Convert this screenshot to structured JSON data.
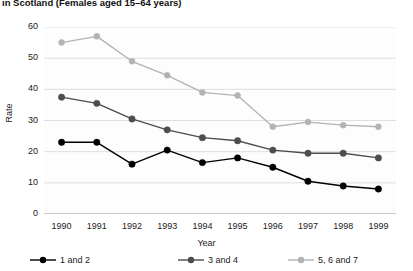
{
  "chart_data": {
    "type": "line",
    "title": "in Scotland (Females aged 15–64 years)",
    "xlabel": "Year",
    "ylabel": "Rate",
    "categories": [
      "1990",
      "1991",
      "1992",
      "1993",
      "1994",
      "1995",
      "1996",
      "1997",
      "1998",
      "1999"
    ],
    "yticks": [
      "0",
      "10",
      "20",
      "30",
      "40",
      "50",
      "60"
    ],
    "ylim": [
      0,
      60
    ],
    "grid": true,
    "legend_position": "bottom",
    "series": [
      {
        "name": "1 and 2",
        "color": "#000000",
        "values": [
          23,
          23,
          16,
          20.5,
          16.5,
          18,
          15,
          10.5,
          9,
          8
        ]
      },
      {
        "name": "3 and 4",
        "color": "#4d4d4d",
        "values": [
          37.5,
          35.5,
          30.5,
          27,
          24.5,
          23.5,
          20.5,
          19.5,
          19.5,
          18
        ]
      },
      {
        "name": "5, 6 and 7",
        "color": "#b3b3b3",
        "values": [
          55,
          57,
          49,
          44.5,
          39,
          38,
          28,
          29.5,
          28.5,
          28
        ]
      }
    ]
  }
}
